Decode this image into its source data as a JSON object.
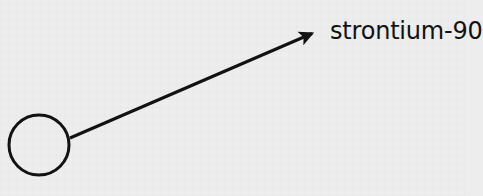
{
  "diagram": {
    "background_color": "#ededed",
    "ink_color": "#121212",
    "nucleus": {
      "icon": "circle-outline-icon",
      "shape": "circle",
      "filled": false,
      "center_x": 39,
      "center_y": 145,
      "radius": 30,
      "stroke_width": 3
    },
    "arrow": {
      "icon": "arrow-up-right-icon",
      "start_x": 70,
      "start_y": 138,
      "end_x": 325,
      "end_y": 28,
      "stroke_width": 3,
      "arrowhead": "filled-triangle"
    },
    "label": {
      "text": "strontium-90",
      "x": 331,
      "y": 40,
      "font_size": 24
    }
  }
}
